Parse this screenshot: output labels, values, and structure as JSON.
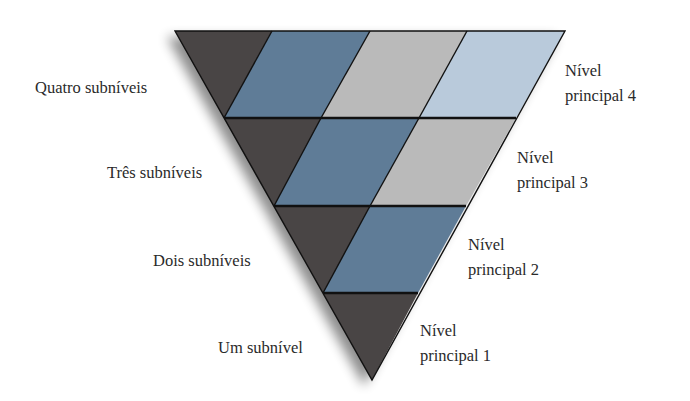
{
  "diagram": {
    "title": "",
    "colors": {
      "subshell_s": "#4a4544",
      "subshell_p": "#5e7b97",
      "subshell_d": "#bababa",
      "subshell_f": "#b9cadb",
      "outline": "#111111"
    },
    "left_labels": [
      {
        "text": "Quatro subníveis"
      },
      {
        "text": "Três subníveis"
      },
      {
        "text": "Dois subníveis"
      },
      {
        "text": "Um subnível"
      }
    ],
    "right_labels": [
      {
        "line1": "Nível",
        "line2": "principal 4"
      },
      {
        "line1": "Nível",
        "line2": "principal 3"
      },
      {
        "line1": "Nível",
        "line2": "principal 2"
      },
      {
        "line1": "Nível",
        "line2": "principal 1"
      }
    ],
    "rows": [
      {
        "level": 4,
        "subshells": 4
      },
      {
        "level": 3,
        "subshells": 3
      },
      {
        "level": 2,
        "subshells": 2
      },
      {
        "level": 1,
        "subshells": 1
      }
    ]
  }
}
